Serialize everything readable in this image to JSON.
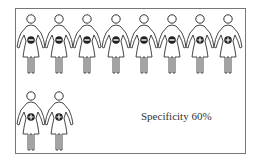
{
  "figure": {
    "label": "Specificity 60%",
    "rows": [
      {
        "items": [
          {
            "sign": "minus"
          },
          {
            "sign": "minus"
          },
          {
            "sign": "minus"
          },
          {
            "sign": "minus"
          },
          {
            "sign": "minus"
          },
          {
            "sign": "minus"
          },
          {
            "sign": "plus"
          },
          {
            "sign": "plus"
          }
        ]
      },
      {
        "items": [
          {
            "sign": "plus"
          },
          {
            "sign": "plus"
          }
        ]
      }
    ],
    "icon": "female-figure-icon",
    "badge_color": "#222222",
    "outline_color": "#333333"
  }
}
